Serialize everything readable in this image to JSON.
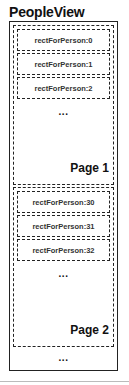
{
  "title": "PeopleView",
  "pages": [
    {
      "label": "Page 1",
      "rows": [
        "rectForPerson:0",
        "rectForPerson:1",
        "rectForPerson:2"
      ],
      "ellipsis": "..."
    },
    {
      "label": "Page 2",
      "rows": [
        "rectForPerson:30",
        "rectForPerson:31",
        "rectForPerson:32"
      ],
      "ellipsis": "..."
    }
  ],
  "trailing_ellipsis": "..."
}
